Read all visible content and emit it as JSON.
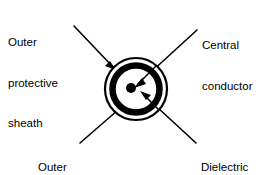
{
  "diagram": {
    "background_color": "#ffffff",
    "stroke_color": "#000000",
    "labels": {
      "outer_protective_sheath": {
        "line1": "Outer",
        "line2": "protective",
        "line3": "sheath"
      },
      "central_conductor": {
        "line1": "Central",
        "line2": "conductor"
      },
      "outer_braid": {
        "line1": "Outer",
        "line2": "braid"
      },
      "dielectric_spacing": {
        "line1": "Dielectric",
        "line2": "spacing"
      }
    },
    "parts": {
      "outer_sheath_ring": "outer thin circle outline",
      "outer_braid_ring": "thick black annulus",
      "dielectric_gap": "white gap between braid and center",
      "central_conductor_dot": "solid black center dot"
    },
    "geometry": {
      "center_x": 136,
      "center_y": 89,
      "outer_sheath_radius": 32,
      "outer_sheath_stroke": 2,
      "braid_outer_radius": 27,
      "braid_stroke": 6,
      "conductor_dot_radius": 5,
      "conductor_dot_x": 131,
      "conductor_dot_y": 88
    }
  }
}
